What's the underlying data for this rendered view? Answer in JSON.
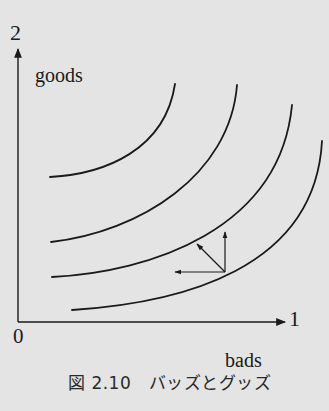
{
  "figure": {
    "caption": "図 2.10　バッズとグッズ",
    "axes": {
      "y_tick": "2",
      "y_label": "goods",
      "x_tick": "1",
      "x_label": "bads",
      "origin": "0"
    },
    "curves": [
      {
        "name": "indifference-curve-1",
        "path": "M50,177 C105,174 165,150 175,84"
      },
      {
        "name": "indifference-curve-2",
        "path": "M51,242 C140,232 230,175 237,85"
      },
      {
        "name": "indifference-curve-3",
        "path": "M52,277 C150,272 280,230 292,105"
      },
      {
        "name": "indifference-curve-4",
        "path": "M72,310 C180,303 315,270 322,141"
      }
    ],
    "vectors": {
      "base": [
        225,
        272
      ],
      "up_tip": [
        225,
        232
      ],
      "left_tip": [
        175,
        272
      ],
      "diagonal_tip": [
        197,
        244
      ]
    }
  },
  "colors": {
    "background": "#e4e4e4",
    "ink": "#1a1a1a"
  }
}
